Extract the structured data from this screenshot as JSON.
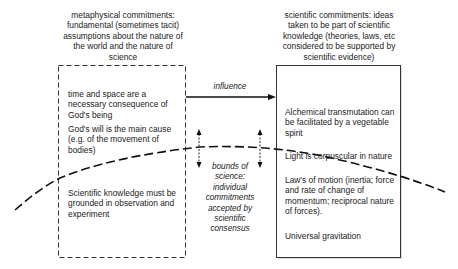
{
  "left_column": {
    "heading": "metaphysical commitments: fundamental (sometimes tacit) assumptions about the nature of the world and the nature of science",
    "items": [
      "time and space are a necessary consequence of God's being",
      "God's will is the main cause (e.g. of the movement of bodies)",
      "Scientific knowledge must be grounded in observation and experiment"
    ]
  },
  "right_column": {
    "heading": "scientific commitments: ideas taken to be part of scientific knowledge (theories, laws, etc considered to be supported by scientific evidence)",
    "items": [
      "Alchemical transmutation can be facilitated by a vegetable spirit",
      "Light is corpuscular in nature",
      "Law's of motion (inertia; force and rate of change of momentum; reciprocal nature of forces).",
      "Universal gravitation"
    ]
  },
  "arrow": {
    "label": "influence"
  },
  "bounds": {
    "label": "bounds of science: individual commitments accepted by scientific consensus"
  }
}
